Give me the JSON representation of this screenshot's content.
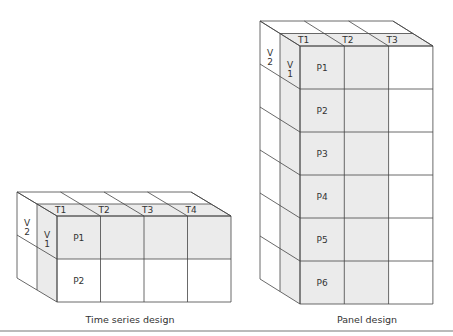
{
  "colors": {
    "shade": "#ebebeb",
    "line": "#444444",
    "rule": "#777777"
  },
  "time_series": {
    "caption": "Time series design",
    "time_labels": [
      "T1",
      "T2",
      "T3",
      "T4"
    ],
    "variable_labels": [
      "V\n1",
      "V\n2"
    ],
    "v1": "V 1",
    "v2": "V 2",
    "panel_labels": [
      "P1",
      "P2"
    ]
  },
  "panel": {
    "caption": "Panel design",
    "time_labels": [
      "T1",
      "T2",
      "T3"
    ],
    "v1": "V 1",
    "v2": "V 2",
    "panel_labels": [
      "P1",
      "P2",
      "P3",
      "P4",
      "P5",
      "P6"
    ]
  }
}
